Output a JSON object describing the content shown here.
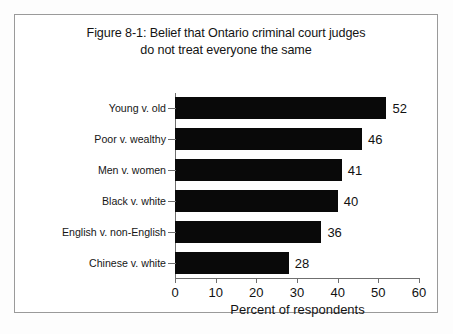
{
  "figure": {
    "title_line_1": "Figure 8-1: Belief that Ontario criminal court judges",
    "title_line_2": "do not treat everyone the same"
  },
  "chart_data": {
    "type": "bar",
    "orientation": "horizontal",
    "title": "Figure 8-1: Belief that Ontario criminal court judges do not treat everyone the same",
    "categories": [
      "Young v. old",
      "Poor v. wealthy",
      "Men v. women",
      "Black v. white",
      "English v. non-English",
      "Chinese v. white"
    ],
    "values": [
      52,
      46,
      41,
      40,
      36,
      28
    ],
    "value_labels": [
      "52",
      "46",
      "41",
      "40",
      "36",
      "28"
    ],
    "xlabel": "Percent of respondents",
    "ylabel": "",
    "xlim": [
      0,
      60
    ],
    "xticks": [
      0,
      10,
      20,
      30,
      40,
      50,
      60
    ],
    "xtick_labels": [
      "0",
      "10",
      "20",
      "30",
      "40",
      "50",
      "60"
    ],
    "grid": false,
    "legend": false,
    "bar_color": "#090909",
    "background_color": "#ffffff",
    "frame_color": "#9a9a9a"
  }
}
